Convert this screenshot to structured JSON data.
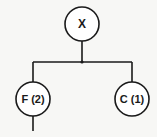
{
  "diagram": {
    "type": "tree",
    "root": {
      "id": "X",
      "label": "X"
    },
    "children": [
      {
        "id": "F",
        "label": "F (2)"
      },
      {
        "id": "C",
        "label": "C (1)"
      }
    ],
    "colors": {
      "stroke": "#1a1a1a",
      "node_fill": "#ffffff",
      "background": "#f7f7f5"
    }
  }
}
